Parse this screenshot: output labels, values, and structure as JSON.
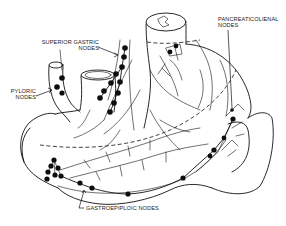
{
  "figure": {
    "labels": {
      "superior_gastric": [
        "SUPERIOR GASTRIC",
        "NODES"
      ],
      "pancreaticolienal": [
        "PANCREATICOLIENAL",
        "NODES"
      ],
      "pyloric": [
        "PYLORIC",
        "NODES"
      ],
      "gastroepiploic": [
        "GASTROEPIPLOIC NODES"
      ]
    },
    "colors": {
      "ink": "#111111",
      "background": "#ffffff"
    }
  }
}
